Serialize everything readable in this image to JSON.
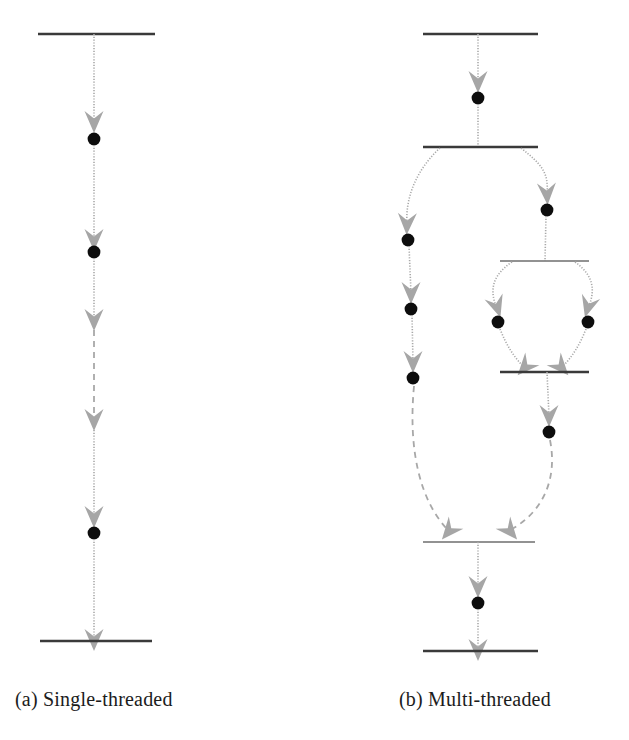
{
  "figure": {
    "type": "uml-activity-diagram",
    "background_color": "#ffffff",
    "bar_color": "#3a3a3a",
    "edge_color": "#9a9a9a",
    "arrow_color": "#a3a3a3",
    "node_color": "#0d0d0d",
    "panels": [
      {
        "id": "panel-a",
        "caption": "(a) Single-threaded",
        "caption_x": 15,
        "caption_y": 688,
        "threads": 1,
        "bars": [
          {
            "name": "start-bar",
            "x1": 38,
            "x2": 155,
            "y": 34,
            "thickness": 2.5
          },
          {
            "name": "end-bar",
            "x1": 40,
            "x2": 152,
            "y": 641,
            "thickness": 2.5
          }
        ],
        "nodes": [
          {
            "name": "node-1",
            "cx": 94,
            "cy": 139,
            "r": 6.5
          },
          {
            "name": "node-2",
            "cx": 94,
            "cy": 252,
            "r": 6.5
          },
          {
            "name": "node-3",
            "cx": 94,
            "cy": 533,
            "r": 6.5
          }
        ],
        "edges": [
          {
            "name": "edge-start-to-n1",
            "x1": 94,
            "y1": 34,
            "x2": 94,
            "y2": 132,
            "style": "solid",
            "arrow_y": 122
          },
          {
            "name": "edge-n1-to-n2",
            "x1": 94,
            "y1": 146,
            "x2": 94,
            "y2": 245,
            "style": "solid",
            "arrow_y": 240
          },
          {
            "name": "edge-n2-to-gap",
            "x1": 94,
            "y1": 259,
            "x2": 94,
            "y2": 320,
            "style": "dotted",
            "arrow_y": 320
          },
          {
            "name": "edge-gap-elided",
            "x1": 94,
            "y1": 322,
            "x2": 94,
            "y2": 420,
            "style": "dashed",
            "arrow_y": 420
          },
          {
            "name": "edge-gap-to-n3",
            "x1": 94,
            "y1": 422,
            "x2": 94,
            "y2": 526,
            "style": "solid",
            "arrow_y": 518
          },
          {
            "name": "edge-n3-to-end",
            "x1": 94,
            "y1": 540,
            "x2": 94,
            "y2": 641,
            "style": "solid",
            "arrow_y": 639
          }
        ]
      },
      {
        "id": "panel-b",
        "caption": "(b) Multi-threaded",
        "caption_x": 399,
        "caption_y": 688,
        "threads": 4,
        "bars": [
          {
            "name": "start-bar",
            "x1": 423,
            "x2": 538,
            "y": 34,
            "thickness": 2.5
          },
          {
            "name": "outer-fork-bar",
            "x1": 423,
            "x2": 538,
            "y": 147,
            "thickness": 2.5
          },
          {
            "name": "inner-fork-bar",
            "x1": 500,
            "x2": 589,
            "y": 261,
            "thickness": 1.6
          },
          {
            "name": "inner-join-bar",
            "x1": 500,
            "x2": 589,
            "y": 372,
            "thickness": 2.5
          },
          {
            "name": "outer-join-bar",
            "x1": 423,
            "x2": 535,
            "y": 542,
            "thickness": 1.6
          },
          {
            "name": "end-bar",
            "x1": 423,
            "x2": 538,
            "y": 651,
            "thickness": 2.5
          }
        ],
        "nodes": [
          {
            "name": "node-main-1",
            "cx": 478,
            "cy": 98,
            "r": 6.5
          },
          {
            "name": "node-left-1",
            "cx": 408,
            "cy": 240,
            "r": 6.5
          },
          {
            "name": "node-left-2",
            "cx": 411,
            "cy": 309,
            "r": 6.5
          },
          {
            "name": "node-left-3",
            "cx": 413,
            "cy": 378,
            "r": 6.5
          },
          {
            "name": "node-right-1",
            "cx": 547,
            "cy": 210,
            "r": 6.5
          },
          {
            "name": "node-inner-left",
            "cx": 498,
            "cy": 322,
            "r": 6.5
          },
          {
            "name": "node-inner-right",
            "cx": 588,
            "cy": 322,
            "r": 6.5
          },
          {
            "name": "node-right-2",
            "cx": 549,
            "cy": 432,
            "r": 6.5
          },
          {
            "name": "node-final",
            "cx": 478,
            "cy": 603,
            "r": 6.5
          }
        ]
      }
    ]
  },
  "captions": {
    "a": "(a) Single-threaded",
    "b": "(b) Multi-threaded"
  }
}
